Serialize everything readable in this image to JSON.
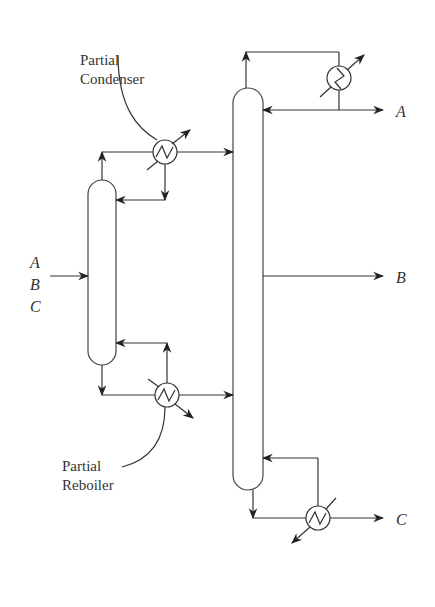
{
  "diagram": {
    "type": "process-flow-diagram",
    "labels": {
      "partial_condenser_line1": "Partial",
      "partial_condenser_line2": "Condenser",
      "partial_reboiler_line1": "Partial",
      "partial_reboiler_line2": "Reboiler"
    },
    "feed": {
      "components": [
        "A",
        "B",
        "C"
      ]
    },
    "products": {
      "top": "A",
      "side": "B",
      "bottom": "C"
    },
    "units": [
      {
        "id": "prefractionator",
        "kind": "column"
      },
      {
        "id": "main-column",
        "kind": "column"
      },
      {
        "id": "partial-condenser",
        "kind": "heat-exchanger"
      },
      {
        "id": "main-condenser",
        "kind": "heat-exchanger"
      },
      {
        "id": "partial-reboiler",
        "kind": "heat-exchanger"
      },
      {
        "id": "main-reboiler",
        "kind": "heat-exchanger"
      }
    ],
    "colors": {
      "line": "#333333",
      "background": "#ffffff"
    }
  }
}
